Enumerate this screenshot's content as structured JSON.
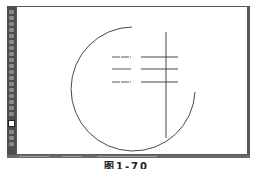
{
  "app": {
    "toolbar": {
      "tools": [
        {
          "icon": "selection-tool-icon"
        },
        {
          "icon": "direct-selection-tool-icon"
        },
        {
          "icon": "magic-wand-tool-icon"
        },
        {
          "icon": "lasso-tool-icon"
        },
        {
          "icon": "pen-tool-icon"
        },
        {
          "icon": "type-tool-icon"
        },
        {
          "icon": "line-segment-tool-icon"
        },
        {
          "icon": "rectangle-tool-icon"
        },
        {
          "icon": "paintbrush-tool-icon"
        },
        {
          "icon": "pencil-tool-icon"
        },
        {
          "icon": "eraser-tool-icon"
        },
        {
          "icon": "rotate-tool-icon"
        },
        {
          "icon": "scale-tool-icon"
        },
        {
          "icon": "warp-tool-icon"
        },
        {
          "icon": "free-transform-tool-icon"
        },
        {
          "icon": "shape-builder-tool-icon"
        },
        {
          "icon": "gradient-tool-icon"
        },
        {
          "icon": "eyedropper-tool-icon"
        }
      ],
      "fill_color": "#ffffff",
      "stroke_color": "#111111"
    },
    "canvas": {
      "background": "#ffffff",
      "stroke_color": "#333333",
      "arc": {
        "cx": 117,
        "cy": 82,
        "r": 62,
        "start_x": 115,
        "start_y": 20,
        "end_x": 178,
        "end_y": 85
      },
      "vertical_line": {
        "x": 149,
        "y1": 25,
        "y2": 131
      },
      "short_lines": [
        {
          "x1": 95,
          "x2": 114,
          "y": 50
        },
        {
          "x1": 95,
          "x2": 114,
          "y": 62
        },
        {
          "x1": 95,
          "x2": 114,
          "y": 75
        }
      ],
      "long_lines": [
        {
          "x1": 124,
          "x2": 161,
          "y": 50
        },
        {
          "x1": 124,
          "x2": 161,
          "y": 62
        },
        {
          "x1": 124,
          "x2": 161,
          "y": 75
        }
      ]
    },
    "status_bar": {}
  },
  "caption": "图1-70"
}
